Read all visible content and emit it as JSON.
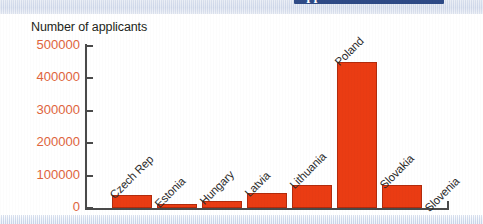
{
  "header": {
    "banner_text": "applicants",
    "banner_color": "#2e4a86"
  },
  "chart_title": "Number of applicants",
  "colors": {
    "bar_fill": "#ea3c13",
    "bar_stroke": "#b22b0c",
    "tick_label": "#e0643c",
    "axis": "#4a4a4a",
    "category_label": "#2b2b2b"
  },
  "chart_data": {
    "type": "bar",
    "title": "Number of applicants",
    "xlabel": "",
    "ylabel": "Number of applicants",
    "ylim": [
      0,
      500000
    ],
    "grid": false,
    "legend": "none",
    "yticks": [
      0,
      100000,
      200000,
      300000,
      400000,
      500000
    ],
    "ytick_labels": [
      "0",
      "100000",
      "200000",
      "300000",
      "400000",
      "500000"
    ],
    "categories": [
      "Czech Rep",
      "Estonia",
      "Hungary",
      "Latvia",
      "Lithuania",
      "Poland",
      "Slovakia",
      "Slovenia"
    ],
    "values": [
      40000,
      13000,
      23000,
      45000,
      70000,
      450000,
      70000,
      1000
    ]
  },
  "ticks": [
    {
      "label": "500000",
      "value": 500000
    },
    {
      "label": "400000",
      "value": 400000
    },
    {
      "label": "300000",
      "value": 300000
    },
    {
      "label": "200000",
      "value": 200000
    },
    {
      "label": "100000",
      "value": 100000
    },
    {
      "label": "0",
      "value": 0
    }
  ],
  "bars": [
    {
      "label": "Czech Rep",
      "value": 40000
    },
    {
      "label": "Estonia",
      "value": 13000
    },
    {
      "label": "Hungary",
      "value": 23000
    },
    {
      "label": "Latvia",
      "value": 45000
    },
    {
      "label": "Lithuania",
      "value": 70000
    },
    {
      "label": "Poland",
      "value": 450000
    },
    {
      "label": "Slovakia",
      "value": 70000
    },
    {
      "label": "Slovenia",
      "value": 1000
    }
  ]
}
